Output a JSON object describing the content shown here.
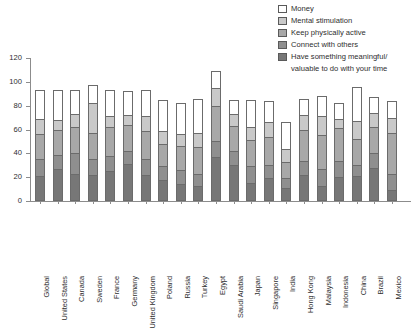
{
  "legend": {
    "items": [
      {
        "label": "Money",
        "color": "#ffffff"
      },
      {
        "label": "Mental stimulation",
        "color": "#c9c9c9"
      },
      {
        "label": "Keep physically active",
        "color": "#a8a8a8"
      },
      {
        "label": "Connect with others",
        "color": "#8f8f8f"
      },
      {
        "label": "Have something meaningful/",
        "color": "#777777"
      }
    ],
    "continuation": "valuable to do with your time"
  },
  "chart_data": {
    "type": "bar",
    "stacked": true,
    "title": "",
    "subtitle": "",
    "xlabel": "",
    "ylabel": "",
    "ylim": [
      0,
      120
    ],
    "yticks": [
      0,
      20,
      40,
      60,
      80,
      100,
      120
    ],
    "grid": false,
    "legend_position": "top-right",
    "categories": [
      "Global",
      "United States",
      "Canada",
      "Sweden",
      "France",
      "Germany",
      "United Kingdom",
      "Poland",
      "Russia",
      "Turkey",
      "Egypt",
      "Saudi Arabia",
      "Japan",
      "Singapore",
      "India",
      "Hong Kong",
      "Malaysia",
      "Indonesia",
      "China",
      "Brazil",
      "Mexico"
    ],
    "series": [
      {
        "name": "Have something meaningful/valuable to do with your time",
        "color": "#777777",
        "values": [
          21,
          27,
          23,
          22,
          25,
          31,
          22,
          18,
          14,
          13,
          37,
          30,
          15,
          19,
          11,
          22,
          13,
          20,
          21,
          28,
          9
        ]
      },
      {
        "name": "Connect with others",
        "color": "#8f8f8f",
        "values": [
          14,
          12,
          17,
          13,
          13,
          11,
          13,
          11,
          12,
          10,
          13,
          12,
          14,
          11,
          8,
          12,
          14,
          14,
          9,
          12,
          14
        ]
      },
      {
        "name": "Keep physically active",
        "color": "#a8a8a8",
        "values": [
          21,
          21,
          22,
          22,
          24,
          22,
          24,
          19,
          20,
          22,
          30,
          21,
          22,
          24,
          14,
          26,
          28,
          27,
          22,
          22,
          34
        ]
      },
      {
        "name": "Mental stimulation",
        "color": "#c9c9c9",
        "values": [
          13,
          8,
          11,
          25,
          9,
          8,
          12,
          11,
          10,
          12,
          15,
          10,
          11,
          12,
          11,
          12,
          16,
          8,
          15,
          12,
          13
        ]
      },
      {
        "name": "Money",
        "color": "#ffffff",
        "values": [
          24,
          25,
          20,
          15,
          22,
          20,
          22,
          26,
          26,
          29,
          14,
          12,
          23,
          18,
          22,
          14,
          17,
          13,
          29,
          13,
          14
        ]
      }
    ],
    "totals": [
      93,
      93,
      93,
      97,
      93,
      92,
      93,
      85,
      82,
      86,
      109,
      85,
      85,
      84,
      66,
      86,
      88,
      82,
      96,
      87,
      84
    ]
  }
}
